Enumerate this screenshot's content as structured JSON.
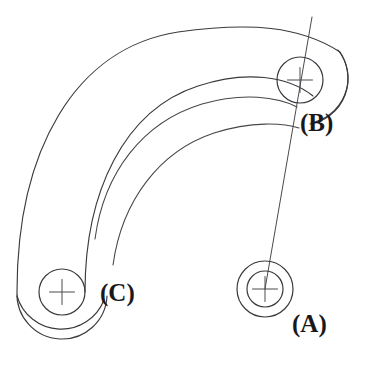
{
  "figure": {
    "background_color": "#ffffff",
    "line_color": "#3a3a3f",
    "label_color": "#19191c",
    "width": 370,
    "height": 369
  },
  "labels": {
    "a": "(A)",
    "b": "(B)",
    "c": "(C)"
  },
  "label_positions": {
    "a": {
      "x": 292,
      "y": 332
    },
    "b": {
      "x": 300,
      "y": 131
    },
    "c": {
      "x": 100,
      "y": 301
    }
  },
  "pivots": {
    "a": {
      "name": "(A)",
      "center_x": 265,
      "center_y": 289,
      "outer_radius": 28,
      "inner_radius": 18,
      "crosshair_length": 17,
      "circle_count": 2
    },
    "b": {
      "name": "(B)",
      "center_x": 300,
      "center_y": 80,
      "outer_radius": 23,
      "inner_radius": 0,
      "crosshair_length": 17,
      "circle_count": 1
    },
    "c": {
      "name": "(C)",
      "center_x": 62,
      "center_y": 292,
      "outer_radius": 23,
      "inner_radius": 0,
      "crosshair_length": 17,
      "circle_count": 1
    }
  },
  "connector_line": {
    "name": "center-line-A-to-B",
    "x1": 265,
    "y1": 289,
    "x2": 312,
    "y2": 17
  },
  "arc_band": {
    "description": "Curved link body sweeping from pivot C up and over to pivot B",
    "sweep_center_x": 196,
    "sweep_center_y": 262,
    "outer_offset": 45,
    "inner_offset": 24,
    "slot_outer_offset": 0,
    "arcs": [
      {
        "name": "outer-boundary-arc",
        "offset": 45
      },
      {
        "name": "inner-boundary-arc",
        "offset": 24
      },
      {
        "name": "slot-outer-arc",
        "offset": -4
      },
      {
        "name": "slot-inner-arc",
        "offset": -22
      }
    ]
  },
  "slot_end_points": {
    "lower_left_outer": {
      "x": 95,
      "y": 238
    },
    "lower_left_inner": {
      "x": 113,
      "y": 264
    },
    "upper_right_outer": {
      "x": 296,
      "y": 104
    },
    "upper_right_inner": {
      "x": 297,
      "y": 123
    }
  }
}
